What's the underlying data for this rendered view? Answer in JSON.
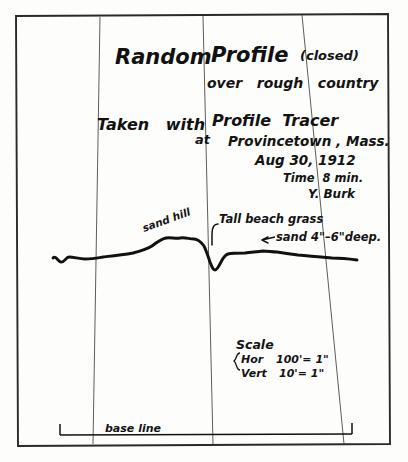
{
  "document": {
    "kind": "handwritten-field-survey-sheet",
    "title_line1_left": "Random",
    "title_line1_right": "Profile",
    "title_parenthetical": "(closed)",
    "title_line2": "over   rough   country",
    "instrument_line_left": "Taken   with",
    "instrument_line_right": "Profile  Tracer",
    "at_label": "at",
    "location": "Provincetown , Mass.",
    "date": "Aug 30, 1912",
    "time": "Time  8 min.",
    "signature": "Y. Burk"
  },
  "profile": {
    "annotations": {
      "sand_hill": "sand hill",
      "tall_beach_grass": "Tall beach grass",
      "sand_depth": "sand 4\"–6\"deep."
    },
    "baseline_label": "base line",
    "curve_path": "M 53,258 C 56,255 58,262 61,262 C 64,263 66,257 69,257 C 74,257 79,259 85,259 C 92,259 97,258 103,257 C 112,256 122,255 133,253 C 141,251 147,249 152,246 C 157,242 161,239 166,238 C 171,237 175,239 180,238 C 185,237 189,239 194,239 C 198,239 201,242 204,246 C 206,250 208,256 210,262 C 212,267 213,270 215,270 C 217,270 219,266 221,262 C 223,258 225,255 228,254 C 232,253 238,253 245,253 C 252,252 258,252 263,251 C 268,251 272,252 277,252 C 283,253 290,254 298,255 C 308,256 320,257 332,258 C 342,258 350,259 357,260",
    "grid_lines": [
      {
        "x1": 100,
        "y1": 18,
        "x2": 93,
        "y2": 441
      },
      {
        "x1": 203,
        "y1": 18,
        "x2": 213,
        "y2": 441
      },
      {
        "x1": 302,
        "y1": 18,
        "x2": 344,
        "y2": 441
      }
    ]
  },
  "scale": {
    "heading": "Scale",
    "horizontal_label": "Hor",
    "horizontal_value": "100'= 1\"",
    "vertical_label": "Vert",
    "vertical_value": "10'= 1\""
  },
  "colors": {
    "ink": "#111111",
    "border": "#2a2a2a",
    "grid": "#4a4a4a",
    "paper": "#fdfdfc"
  }
}
